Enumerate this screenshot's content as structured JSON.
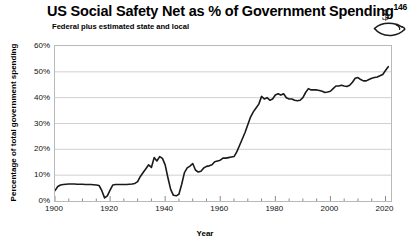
{
  "chart_data": {
    "type": "line",
    "title": "US Social Safety Net as % of Government Spending",
    "title_superscript": "146",
    "subtitle": "Federal plus estimated state and local",
    "xlabel": "Year",
    "ylabel": "Percentage of total government spending",
    "xlim": [
      1900,
      2022
    ],
    "ylim": [
      0,
      60
    ],
    "xticks": [
      1900,
      1920,
      1940,
      1960,
      1980,
      2000,
      2020
    ],
    "xtick_labels": [
      "1900",
      "1920",
      "1940",
      "1960",
      "1980",
      "2000",
      "2020"
    ],
    "x_minor_tick_interval": 5,
    "yticks": [
      0,
      10,
      20,
      30,
      40,
      50,
      60
    ],
    "ytick_labels": [
      "0%",
      "10%",
      "20%",
      "30%",
      "40%",
      "50%",
      "60%"
    ],
    "grid": "horizontal",
    "grid_color": "#d0d0d0",
    "legend": null,
    "line_color": "#1a1a1a",
    "line_width": 1.6,
    "series": [
      {
        "name": "Social safety net share of government spending",
        "x": [
          1900,
          1901,
          1902,
          1903,
          1904,
          1905,
          1906,
          1907,
          1908,
          1909,
          1910,
          1911,
          1912,
          1913,
          1914,
          1915,
          1916,
          1917,
          1918,
          1919,
          1920,
          1921,
          1922,
          1923,
          1924,
          1925,
          1926,
          1927,
          1928,
          1929,
          1930,
          1931,
          1932,
          1933,
          1934,
          1935,
          1936,
          1937,
          1938,
          1939,
          1940,
          1941,
          1942,
          1943,
          1944,
          1945,
          1946,
          1947,
          1948,
          1949,
          1950,
          1951,
          1952,
          1953,
          1954,
          1955,
          1956,
          1957,
          1958,
          1959,
          1960,
          1961,
          1962,
          1963,
          1964,
          1965,
          1966,
          1967,
          1968,
          1969,
          1970,
          1971,
          1972,
          1973,
          1974,
          1975,
          1976,
          1977,
          1978,
          1979,
          1980,
          1981,
          1982,
          1983,
          1984,
          1985,
          1986,
          1987,
          1988,
          1989,
          1990,
          1991,
          1992,
          1993,
          1994,
          1995,
          1996,
          1997,
          1998,
          1999,
          2000,
          2001,
          2002,
          2003,
          2004,
          2005,
          2006,
          2007,
          2008,
          2009,
          2010,
          2011,
          2012,
          2013,
          2014,
          2015,
          2016,
          2017,
          2018,
          2019,
          2020,
          2021
        ],
        "y": [
          4.0,
          5.6,
          6.2,
          6.4,
          6.5,
          6.6,
          6.6,
          6.6,
          6.5,
          6.5,
          6.5,
          6.4,
          6.4,
          6.4,
          6.3,
          6.2,
          6.0,
          4.0,
          1.2,
          2.0,
          4.2,
          6.2,
          6.4,
          6.4,
          6.4,
          6.4,
          6.4,
          6.5,
          6.6,
          6.8,
          7.5,
          9.5,
          11.0,
          12.5,
          14.0,
          13.0,
          16.8,
          15.5,
          17.2,
          16.5,
          14.0,
          9.0,
          4.5,
          2.2,
          2.0,
          2.6,
          6.5,
          11.0,
          12.8,
          13.5,
          14.5,
          12.0,
          11.2,
          11.5,
          12.8,
          13.4,
          13.6,
          14.0,
          15.2,
          15.5,
          15.8,
          16.6,
          16.6,
          16.8,
          17.0,
          17.2,
          19.0,
          21.5,
          24.0,
          26.5,
          29.5,
          32.5,
          34.5,
          36.0,
          37.5,
          40.5,
          39.5,
          40.0,
          39.0,
          39.5,
          41.0,
          41.5,
          41.0,
          41.5,
          40.0,
          39.5,
          39.5,
          39.0,
          38.8,
          39.0,
          40.0,
          42.0,
          43.5,
          43.0,
          43.0,
          43.0,
          42.8,
          42.5,
          42.0,
          42.2,
          42.5,
          43.5,
          44.5,
          44.5,
          44.8,
          44.5,
          44.3,
          44.8,
          46.0,
          47.5,
          47.8,
          47.0,
          46.5,
          46.5,
          47.0,
          47.5,
          47.8,
          48.0,
          48.5,
          49.0,
          50.5,
          52.0
        ]
      }
    ]
  },
  "icons": {
    "charity_hand_dollar": "hand-holding-dollar-icon"
  }
}
